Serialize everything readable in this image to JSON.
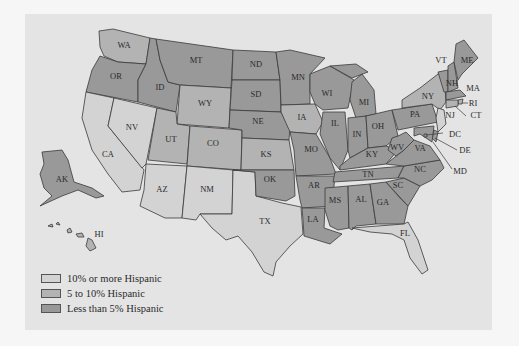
{
  "map": {
    "title": "",
    "colors": {
      "high": "#d3d3d3",
      "mid": "#b3b3b3",
      "low": "#999999",
      "background": "#e4e4e4"
    },
    "legend": [
      {
        "key": "high",
        "label": "10% or more Hispanic"
      },
      {
        "key": "mid",
        "label": "5 to 10% Hispanic"
      },
      {
        "key": "low",
        "label": "Less than 5% Hispanic"
      }
    ],
    "states": {
      "WA": "mid",
      "OR": "low",
      "CA": "high",
      "NV": "high",
      "ID": "low",
      "MT": "low",
      "WY": "mid",
      "UT": "mid",
      "CO": "mid",
      "AZ": "high",
      "NM": "high",
      "TX": "high",
      "ND": "low",
      "SD": "low",
      "NE": "low",
      "KS": "mid",
      "OK": "low",
      "MN": "low",
      "IA": "mid",
      "MO": "low",
      "AR": "low",
      "LA": "low",
      "WI": "low",
      "IL": "low",
      "MI": "low",
      "IN": "low",
      "OH": "low",
      "KY": "low",
      "TN": "low",
      "MS": "low",
      "AL": "low",
      "GA": "low",
      "FL": "high",
      "SC": "low",
      "NC": "low",
      "VA": "low",
      "WV": "low",
      "PA": "low",
      "NY": "mid",
      "VT": "low",
      "NH": "low",
      "ME": "low",
      "MA": "low",
      "RI": "mid",
      "CT": "mid",
      "NJ": "high",
      "DE": "low",
      "MD": "low",
      "DC": "low",
      "AK": "low",
      "HI": "mid"
    },
    "labels": [
      "WA",
      "OR",
      "CA",
      "NV",
      "ID",
      "MT",
      "WY",
      "UT",
      "CO",
      "AZ",
      "NM",
      "TX",
      "ND",
      "SD",
      "NE",
      "KS",
      "OK",
      "MN",
      "IA",
      "MO",
      "AR",
      "LA",
      "WI",
      "IL",
      "MI",
      "IN",
      "OH",
      "KY",
      "TN",
      "MS",
      "AL",
      "GA",
      "FL",
      "SC",
      "NC",
      "VA",
      "WV",
      "PA",
      "NY",
      "VT",
      "NH",
      "ME",
      "MA",
      "RI",
      "CT",
      "NJ",
      "DE",
      "MD",
      "DC",
      "AK",
      "HI"
    ]
  }
}
